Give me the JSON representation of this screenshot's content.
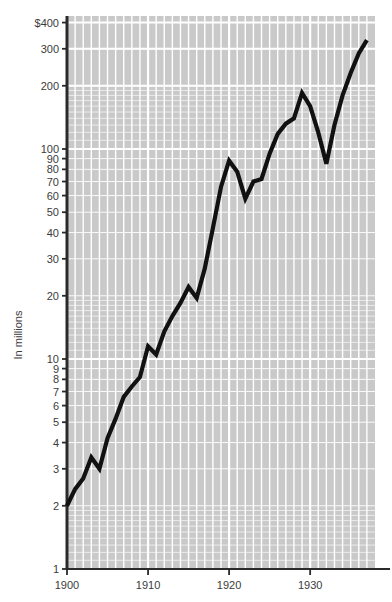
{
  "figure": {
    "background_color": "#ffffff",
    "plot_background_color": "#c9c9c9",
    "gridline_color": "#ffffff",
    "axis_color": "#2a2a2a",
    "line_color": "#111111",
    "tick_label_color": "#3b3b3b"
  },
  "chart_data": {
    "type": "line",
    "title": "",
    "subtitle": "",
    "xlabel": "",
    "ylabel": "In millions",
    "yscale": "log",
    "xscale": "linear",
    "grid": true,
    "legend": false,
    "legend_position": "none",
    "xlim": [
      1899.0,
      1937.0
    ],
    "ylim": [
      1,
      400
    ],
    "x_tick_labels": [
      "1900",
      "1910",
      "1920",
      "1930"
    ],
    "x_tick_values": [
      1900,
      1910,
      1920,
      1930
    ],
    "y_tick_labels": [
      "1",
      "2",
      "3",
      "4",
      "5",
      "6",
      "7",
      "8",
      "9",
      "10",
      "20",
      "30",
      "40",
      "50",
      "60",
      "70",
      "80",
      "90",
      "100",
      "200",
      "300",
      "$400"
    ],
    "y_tick_values": [
      1,
      2,
      3,
      4,
      5,
      6,
      7,
      8,
      9,
      10,
      20,
      30,
      40,
      50,
      60,
      70,
      80,
      90,
      100,
      200,
      300,
      400
    ],
    "y_major_labeled": [
      1,
      2,
      3,
      4,
      5,
      6,
      7,
      8,
      9,
      10,
      20,
      30,
      40,
      50,
      60,
      70,
      80,
      90,
      100,
      200,
      300,
      400
    ],
    "currency_marker_on": 400,
    "series": [
      {
        "name": "value",
        "x": [
          1900,
          1901,
          1902,
          1903,
          1904,
          1905,
          1906,
          1907,
          1908,
          1909,
          1910,
          1911,
          1912,
          1913,
          1914,
          1915,
          1916,
          1917,
          1918,
          1919,
          1920,
          1921,
          1922,
          1923,
          1924,
          1925,
          1926,
          1927,
          1928,
          1929,
          1930,
          1931,
          1932,
          1933,
          1934,
          1935,
          1936,
          1937
        ],
        "values": [
          2.0,
          2.4,
          2.7,
          3.4,
          3.0,
          4.2,
          5.2,
          6.6,
          7.4,
          8.2,
          11.5,
          10.5,
          13.5,
          16.0,
          18.5,
          22.0,
          19.5,
          27.0,
          42.0,
          66.0,
          88.0,
          78.0,
          58.0,
          70.0,
          72.0,
          95.0,
          118.0,
          132.0,
          140.0,
          185.0,
          160.0,
          120.0,
          85.0,
          130.0,
          180.0,
          230.0,
          285.0,
          330.0
        ]
      }
    ]
  }
}
